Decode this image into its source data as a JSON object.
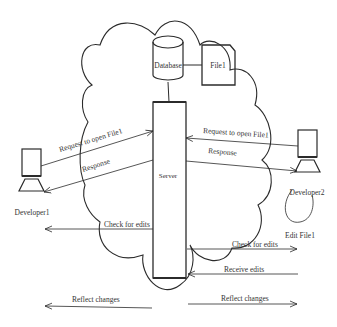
{
  "diagram": {
    "nodes": {
      "database": {
        "label": "Database"
      },
      "file": {
        "label": "File1"
      },
      "server": {
        "label": "Server"
      },
      "developer1": {
        "label": "Developer1"
      },
      "developer2": {
        "label": "Developer2"
      }
    },
    "annotations": {
      "edit_file": "Edit File1"
    },
    "edges": {
      "dev1_request": "Request to open File1",
      "dev1_response": "Response",
      "dev2_request": "Request to open File1",
      "dev2_response": "Response",
      "check_edits_left": "Check for edits",
      "check_edits_right": "Check for edits",
      "receive_edits": "Receive edits",
      "reflect_left": "Reflect changes",
      "reflect_right": "Reflect changes"
    },
    "colors": {
      "line": "#2b2b2b",
      "text": "#333333",
      "background": "#ffffff"
    }
  }
}
